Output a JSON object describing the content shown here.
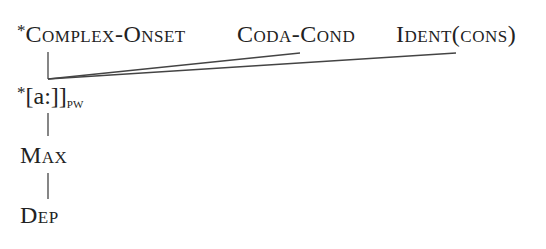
{
  "diagram": {
    "type": "constraint-ranking-hasse",
    "top_row": [
      {
        "prefix": "*",
        "label": "Complex-Onset"
      },
      {
        "prefix": "",
        "label": "Coda-Cond"
      },
      {
        "prefix": "",
        "label": "Ident(cons)"
      }
    ],
    "chain": [
      {
        "prefix": "*",
        "label": "[a:]]",
        "subscript": "pw"
      },
      {
        "prefix": "",
        "label": "Max",
        "subscript": ""
      },
      {
        "prefix": "",
        "label": "Dep",
        "subscript": ""
      }
    ],
    "line_color": "#444444",
    "text_color": "#222222"
  }
}
